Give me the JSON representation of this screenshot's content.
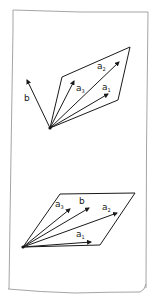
{
  "figure": {
    "colors": {
      "ink": "#1a1a1a",
      "paper_edge": "#9a9a9a",
      "background": "#ffffff"
    }
  },
  "top_diagram": {
    "caption": "b not in the plane of a1, a2, a3",
    "labels": {
      "b": "b",
      "a1_base": "a",
      "a1_sub": "1",
      "a2_base": "a",
      "a2_sub": "2",
      "a3_base": "a",
      "a3_sub": "3"
    }
  },
  "bottom_diagram": {
    "caption": "b lies in the plane of a1, a2, a3",
    "labels": {
      "b": "b",
      "a1_base": "a",
      "a1_sub": "1",
      "a2_base": "a",
      "a2_sub": "2",
      "a3_base": "a",
      "a3_sub": "3"
    }
  }
}
